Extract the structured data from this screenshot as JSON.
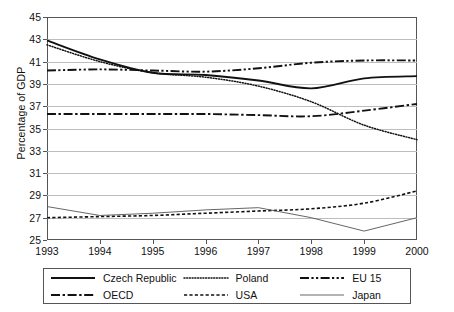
{
  "chart_data": {
    "type": "line",
    "title": "",
    "xlabel": "",
    "ylabel": "Percentage of GDP",
    "x": [
      1993,
      1994,
      1995,
      1996,
      1997,
      1998,
      1999,
      2000
    ],
    "xtick_labels": [
      "1993",
      "1994",
      "1995",
      "1996",
      "1997",
      "1998",
      "1999",
      "2000"
    ],
    "ytick_labels": [
      "25",
      "27",
      "29",
      "31",
      "33",
      "35",
      "37",
      "39",
      "41",
      "43",
      "45"
    ],
    "ytick_values": [
      25,
      27,
      29,
      31,
      33,
      35,
      37,
      39,
      41,
      43,
      45
    ],
    "ylim": [
      25,
      45
    ],
    "xlim": [
      1993,
      2000
    ],
    "grid": "horizontal",
    "legend_position": "below-plot",
    "legend_columns": 3,
    "series": [
      {
        "name": "Czech Republic",
        "style": "solid",
        "width": 1.9,
        "color": "#111111",
        "values": [
          42.9,
          41.2,
          40.0,
          39.8,
          39.3,
          38.6,
          39.5,
          39.7
        ]
      },
      {
        "name": "Poland",
        "style": "dotted",
        "width": 1.5,
        "color": "#111111",
        "values": [
          42.5,
          41.0,
          40.0,
          39.6,
          38.8,
          37.4,
          35.3,
          34.0
        ]
      },
      {
        "name": "EU 15",
        "style": "dash-dot-dot",
        "width": 1.9,
        "color": "#111111",
        "values": [
          40.2,
          40.3,
          40.2,
          40.1,
          40.4,
          40.9,
          41.1,
          41.1
        ]
      },
      {
        "name": "OECD",
        "style": "dash-dot",
        "width": 1.9,
        "color": "#111111",
        "values": [
          36.3,
          36.3,
          36.3,
          36.3,
          36.2,
          36.1,
          36.6,
          37.2
        ]
      },
      {
        "name": "USA",
        "style": "dashed",
        "width": 1.6,
        "color": "#111111",
        "values": [
          27.0,
          27.1,
          27.2,
          27.4,
          27.6,
          27.8,
          28.3,
          29.4
        ]
      },
      {
        "name": "Japan",
        "style": "solid-thin",
        "width": 0.9,
        "color": "#555555",
        "values": [
          28.0,
          27.2,
          27.4,
          27.7,
          27.9,
          27.0,
          25.8,
          27.0
        ]
      }
    ]
  },
  "axis": {
    "y_title": "Percentage of GDP"
  },
  "legend": {
    "items": [
      {
        "label": "Czech Republic"
      },
      {
        "label": "Poland"
      },
      {
        "label": "EU 15"
      },
      {
        "label": "OECD"
      },
      {
        "label": "USA"
      },
      {
        "label": "Japan"
      }
    ]
  },
  "colors": {
    "frame": "#555555",
    "grid": "#bdbdbd",
    "ink": "#111111",
    "background": "#ffffff"
  }
}
